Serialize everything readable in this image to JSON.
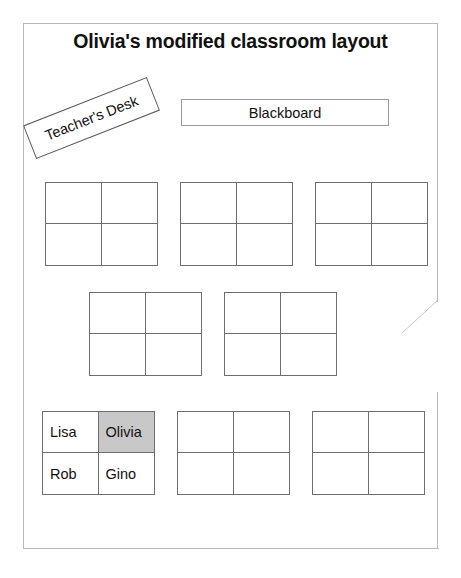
{
  "page": {
    "title": "Olivia's modified classroom layout",
    "border_color": "#b9b9b9",
    "background": "#ffffff"
  },
  "fixtures": {
    "teachers_desk": {
      "label": "Teacher's Desk",
      "rotation_deg": -21.5
    },
    "blackboard": {
      "label": "Blackboard"
    }
  },
  "legend": {
    "highlight_color": "#c8c8c8",
    "desk_outline_color": "#6e6e6e"
  },
  "desk_rows": [
    {
      "row_name": "row-1",
      "groups": [
        {
          "group_name": "desk-group-1",
          "seats": [
            "",
            "",
            "",
            ""
          ],
          "highlighted": [
            false,
            false,
            false,
            false
          ]
        },
        {
          "group_name": "desk-group-2",
          "seats": [
            "",
            "",
            "",
            ""
          ],
          "highlighted": [
            false,
            false,
            false,
            false
          ]
        },
        {
          "group_name": "desk-group-3",
          "seats": [
            "",
            "",
            "",
            ""
          ],
          "highlighted": [
            false,
            false,
            false,
            false
          ]
        }
      ]
    },
    {
      "row_name": "row-2",
      "groups": [
        {
          "group_name": "desk-group-4",
          "seats": [
            "",
            "",
            "",
            ""
          ],
          "highlighted": [
            false,
            false,
            false,
            false
          ]
        },
        {
          "group_name": "desk-group-5",
          "seats": [
            "",
            "",
            "",
            ""
          ],
          "highlighted": [
            false,
            false,
            false,
            false
          ]
        }
      ]
    },
    {
      "row_name": "row-3",
      "groups": [
        {
          "group_name": "desk-group-6",
          "seats": [
            "Lisa",
            "Olivia",
            "Rob",
            "Gino"
          ],
          "highlighted": [
            false,
            true,
            false,
            false
          ]
        },
        {
          "group_name": "desk-group-7",
          "seats": [
            "",
            "",
            "",
            ""
          ],
          "highlighted": [
            false,
            false,
            false,
            false
          ]
        },
        {
          "group_name": "desk-group-8",
          "seats": [
            "",
            "",
            "",
            ""
          ],
          "highlighted": [
            false,
            false,
            false,
            false
          ]
        }
      ]
    }
  ]
}
